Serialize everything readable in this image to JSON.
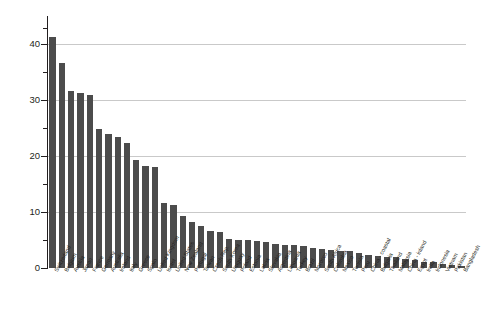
{
  "chart_data": {
    "type": "bar",
    "title": "",
    "subtitle": "",
    "xlabel": "",
    "ylabel": "US$ per operator-hour",
    "ylim": [
      0,
      44
    ],
    "ytick_labels": [
      "0",
      "10",
      "20",
      "30",
      "40"
    ],
    "ytick_values": [
      0,
      10,
      20,
      30,
      40
    ],
    "yminor_values": [
      5,
      15,
      25,
      35
    ],
    "grid": "horizontal",
    "legend": "none",
    "bar_color": "#4c4c4c",
    "categories": [
      "Switzerland",
      "Belgium",
      "Austria",
      "Japan",
      "France",
      "Germany",
      "Australia",
      "Ireland",
      "Italy",
      "Greece",
      "Spain",
      "United Kingdom",
      "Israel",
      "United States",
      "New Zealand",
      "Portugal",
      "Taiwan",
      "Czech Rep.",
      "South Korea",
      "Uruguay",
      "Poland",
      "Estonia",
      "Latvia",
      "Slovakia",
      "Argentina",
      "Lithuania",
      "Turkey",
      "Brazil",
      "Morocco",
      "South Africa",
      "Colombia",
      "Mexico",
      "Tunisia",
      "Peru",
      "China - coastal",
      "Bulgaria",
      "Thailand",
      "Malaysia",
      "China - inland",
      "Egypt",
      "India",
      "Indonesia",
      "Vietnam",
      "Pakistan",
      "Bangladesh"
    ],
    "values": [
      41.3,
      36.7,
      31.7,
      31.3,
      30.9,
      24.8,
      23.9,
      23.5,
      22.3,
      19.3,
      18.2,
      18.0,
      11.6,
      11.3,
      9.3,
      8.2,
      7.6,
      6.6,
      6.4,
      5.2,
      5.1,
      5.0,
      4.8,
      4.7,
      4.3,
      4.2,
      4.1,
      3.9,
      3.5,
      3.4,
      3.2,
      3.1,
      3.0,
      2.7,
      2.3,
      2.2,
      2.0,
      1.9,
      1.6,
      1.5,
      1.1,
      1.0,
      0.8,
      0.6,
      0.4
    ]
  }
}
